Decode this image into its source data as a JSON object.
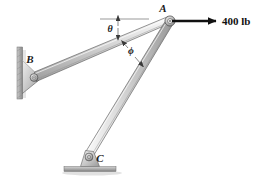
{
  "figure": {
    "background_color": "#ffffff"
  },
  "joints": [
    {
      "id": "A",
      "label": "A",
      "x": 170,
      "y": 21,
      "type": "pin-joint",
      "label_x": 163,
      "label_y": 12
    },
    {
      "id": "B",
      "label": "B",
      "x": 33,
      "y": 77,
      "type": "wall-pin-support",
      "label_x": 30,
      "label_y": 62
    },
    {
      "id": "C",
      "label": "C",
      "x": 89,
      "y": 157,
      "type": "ground-pin-support",
      "label_x": 100,
      "label_y": 162
    }
  ],
  "members": [
    {
      "id": "AB",
      "from": "B",
      "to": "A",
      "style": "tapered-bar"
    },
    {
      "id": "AC",
      "from": "C",
      "to": "A",
      "style": "tapered-bar"
    }
  ],
  "angles": [
    {
      "id": "theta",
      "label": "θ",
      "label_x": 110,
      "label_y": 32,
      "between": "horizontal-reference-and-member-AB"
    },
    {
      "id": "phi",
      "label": "ϕ",
      "label_x": 131,
      "label_y": 53,
      "between": "member-AB-and-member-AC"
    }
  ],
  "reference_line": {
    "name": "horizontal-dimension-line",
    "x1": 100,
    "y1": 19,
    "x2": 149,
    "y2": 19
  },
  "force": {
    "label": "400 lb",
    "magnitude": 400,
    "units": "lb",
    "direction": "horizontal-right",
    "applied_at": "A",
    "arrow_x1": 172,
    "arrow_y1": 21,
    "arrow_x2": 218,
    "arrow_y2": 21,
    "label_x": 222,
    "label_y": 25,
    "color": "#111111"
  },
  "supports": {
    "wall": {
      "name": "wall-plate",
      "x": 17,
      "y": 47,
      "width": 5,
      "height": 52,
      "color": "#9a9a9a"
    },
    "ground": {
      "name": "ground-plate",
      "x": 64,
      "y": 167,
      "width": 52,
      "height": 5,
      "color": "#a8a8a8"
    }
  },
  "colors": {
    "member_light": "#e8e8e8",
    "member_mid": "#c9c9c9",
    "member_dark": "#9d9d9d",
    "outline": "#4d4d4d",
    "metal_gray": "#b4b4b4",
    "shadow": "#d6d6d6",
    "text": "#1a1a1a",
    "arrow": "#111111"
  }
}
